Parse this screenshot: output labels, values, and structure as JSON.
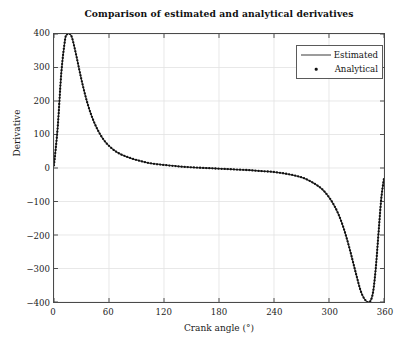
{
  "chart_data": {
    "type": "line",
    "title": "Comparison of estimated and analytical derivatives",
    "xlabel": "Crank angle (°)",
    "ylabel": "Derivative",
    "xlim": [
      0,
      360
    ],
    "ylim": [
      -400,
      400
    ],
    "xticks": [
      0,
      60,
      120,
      180,
      240,
      300,
      360
    ],
    "yticks": [
      400,
      300,
      200,
      100,
      0,
      -100,
      -200,
      -300,
      -400
    ],
    "xtick_labels": [
      "0",
      "60",
      "120",
      "180",
      "240",
      "300",
      "360"
    ],
    "ytick_labels": [
      "400",
      "300",
      "200",
      "100",
      "0",
      "−100",
      "−200",
      "−300",
      "−400"
    ],
    "grid": true,
    "grid_color": "#e2e2e2",
    "legend_position": "upper right",
    "legend": [
      {
        "name": "Estimated",
        "style": "line",
        "color": "#3a3a3a"
      },
      {
        "name": "Analytical",
        "style": "dot",
        "color": "#111111"
      }
    ],
    "series": [
      {
        "name": "Estimated",
        "style": "line",
        "x": [
          0,
          4,
          8,
          12,
          14,
          16,
          18,
          20,
          24,
          28,
          32,
          36,
          40,
          44,
          48,
          52,
          56,
          60,
          66,
          72,
          78,
          84,
          90,
          100,
          110,
          120,
          135,
          150,
          165,
          180,
          195,
          210,
          225,
          240,
          255,
          265,
          275,
          285,
          292,
          298,
          304,
          310,
          316,
          322,
          328,
          334,
          338,
          342,
          345,
          348,
          351,
          354,
          357,
          360
        ],
        "y": [
          8,
          120,
          285,
          382,
          398,
          402,
          398,
          386,
          340,
          288,
          240,
          198,
          163,
          135,
          112,
          93,
          78,
          66,
          52,
          42,
          35,
          29,
          24,
          17,
          12,
          9,
          5,
          2,
          0,
          -2,
          -4,
          -6,
          -9,
          -12,
          -18,
          -24,
          -33,
          -48,
          -62,
          -80,
          -104,
          -136,
          -180,
          -236,
          -300,
          -362,
          -388,
          -400,
          -398,
          -372,
          -300,
          -195,
          -92,
          -30
        ]
      },
      {
        "name": "Analytical",
        "style": "dot",
        "x": [
          0,
          4,
          8,
          12,
          14,
          16,
          18,
          20,
          24,
          28,
          32,
          36,
          40,
          44,
          48,
          52,
          56,
          60,
          66,
          72,
          78,
          84,
          90,
          100,
          110,
          120,
          135,
          150,
          165,
          180,
          195,
          210,
          225,
          240,
          255,
          265,
          275,
          285,
          292,
          298,
          304,
          310,
          316,
          322,
          328,
          334,
          338,
          342,
          345,
          348,
          351,
          354,
          357,
          360
        ],
        "y": [
          8,
          120,
          285,
          382,
          398,
          402,
          398,
          386,
          340,
          288,
          240,
          198,
          163,
          135,
          112,
          93,
          78,
          66,
          52,
          42,
          35,
          29,
          24,
          17,
          12,
          9,
          5,
          2,
          0,
          -2,
          -4,
          -6,
          -9,
          -12,
          -18,
          -24,
          -33,
          -48,
          -62,
          -80,
          -104,
          -136,
          -180,
          -236,
          -300,
          -362,
          -388,
          -400,
          -398,
          -372,
          -300,
          -195,
          -92,
          -30
        ]
      }
    ]
  }
}
